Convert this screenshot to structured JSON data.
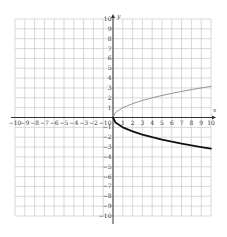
{
  "chart_data": {
    "type": "line",
    "title": "",
    "xlabel": "x",
    "ylabel": "y",
    "xlim": [
      -10,
      10
    ],
    "ylim": [
      -10,
      10
    ],
    "grid": true,
    "legend": null,
    "x_ticks": [
      "-10",
      "-9",
      "-8",
      "-7",
      "-6",
      "-5",
      "-4",
      "-3",
      "-2",
      "-1",
      "1",
      "2",
      "3",
      "4",
      "5",
      "6",
      "7",
      "8",
      "9",
      "10"
    ],
    "y_ticks": [
      "10",
      "9",
      "8",
      "7",
      "6",
      "5",
      "4",
      "3",
      "2",
      "1",
      "-1",
      "-2",
      "-3",
      "-4",
      "-5",
      "-6",
      "-7",
      "-8",
      "-9",
      "-10"
    ],
    "origin_label": "0",
    "series": [
      {
        "name": "upper branch (y = √x)",
        "color": "#888888",
        "style": "thin",
        "x": [
          0,
          0.25,
          1,
          2,
          3,
          4,
          5,
          6,
          7,
          8,
          9,
          10
        ],
        "y": [
          0,
          0.5,
          1,
          1.41,
          1.73,
          2,
          2.24,
          2.45,
          2.65,
          2.83,
          3,
          3.16
        ]
      },
      {
        "name": "lower branch (y = -√x)",
        "color": "#111111",
        "style": "thick",
        "x": [
          0,
          0.25,
          1,
          2,
          3,
          4,
          5,
          6,
          7,
          8,
          9,
          10
        ],
        "y": [
          0,
          -0.5,
          -1,
          -1.41,
          -1.73,
          -2,
          -2.24,
          -2.45,
          -2.65,
          -2.83,
          -3,
          -3.16
        ]
      }
    ]
  },
  "axes": {
    "x_label": "x",
    "y_label": "y"
  }
}
